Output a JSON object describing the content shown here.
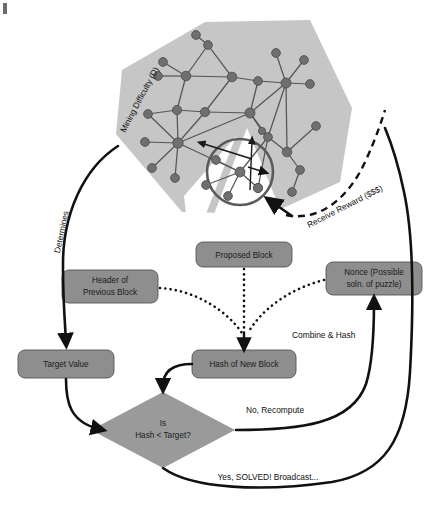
{
  "diagram": {
    "background_color": "#ffffff",
    "box_fill": "#8e8e8e",
    "diamond_fill": "#9a9a9a",
    "pentagon_fill": "#c6c6c6",
    "node_fill": "#6f6f6f",
    "line_color": "#111111"
  },
  "nodes": {
    "proposed_block": "Proposed Block",
    "header_previous_block_line1": "Header of",
    "header_previous_block_line2": "Previous Block",
    "nonce_line1": "Nonce (Possible",
    "nonce_line2": "soln. of puzzle)",
    "target_value": "Target Value",
    "hash_of_new_block": "Hash of New Block",
    "decision_line1": "Is",
    "decision_line2": "Hash < Target?"
  },
  "edge_labels": {
    "combine_and_hash": "Combine & Hash",
    "no_recompute": "No, Recompute",
    "yes_solved": "Yes, SOLVED! Broadcast...",
    "determines": "Determines",
    "receive_reward": "Receive Reward ($$$)",
    "mining_difficulty": "Mining Difficulty (D)"
  },
  "network": {
    "node_count": 26,
    "edge_count": 36,
    "magnifier_label": "magnified-network-inset"
  }
}
